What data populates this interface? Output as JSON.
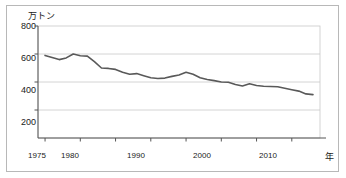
{
  "chart_data": {
    "type": "line",
    "title": "",
    "subtitle": "",
    "xlabel": "年",
    "ylabel": "万トン",
    "unit_label": "万トン",
    "xlim": [
      1974,
      2014
    ],
    "ylim": [
      0,
      800
    ],
    "y_ticks": [
      200,
      400,
      600,
      800
    ],
    "y_tick_labels": [
      "200",
      "400",
      "600",
      "800"
    ],
    "x_ticks": [
      1975,
      1980,
      1985,
      1990,
      1995,
      2000,
      2005,
      2010
    ],
    "x_tick_labels_shown": [
      "1975",
      "1980",
      "1990",
      "2000",
      "2010"
    ],
    "grid": "horizontal",
    "legend": "none",
    "series": [
      {
        "name": "生産量",
        "color": "#595959",
        "x": [
          1975,
          1976,
          1977,
          1978,
          1979,
          1980,
          1981,
          1982,
          1983,
          1984,
          1985,
          1986,
          1987,
          1988,
          1989,
          1990,
          1991,
          1992,
          1993,
          1994,
          1995,
          1996,
          1997,
          1998,
          1999,
          2000,
          2001,
          2002,
          2003,
          2004,
          2005,
          2006,
          2007,
          2008,
          2009,
          2010,
          2011,
          2012,
          2013
        ],
        "values": [
          590,
          575,
          560,
          572,
          600,
          588,
          585,
          545,
          500,
          497,
          490,
          470,
          455,
          460,
          445,
          430,
          425,
          428,
          440,
          450,
          470,
          455,
          430,
          418,
          410,
          400,
          398,
          382,
          372,
          388,
          375,
          370,
          368,
          366,
          355,
          345,
          335,
          315,
          310
        ]
      }
    ]
  },
  "axes": {
    "unit_label": "万トン",
    "x_axis_name": "年",
    "y_tick_labels": [
      "800",
      "600",
      "400",
      "200"
    ],
    "x_tick_labels": [
      "1975",
      "1980",
      "1990",
      "2000",
      "2010"
    ]
  },
  "colors": {
    "line": "#595959",
    "grid": "#c9c9c9",
    "axis": "#555555",
    "frame": "#b8b8b8",
    "text": "#1a1a1a",
    "background": "#ffffff"
  }
}
